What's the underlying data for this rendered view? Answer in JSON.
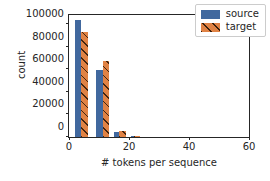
{
  "chart_data": {
    "type": "bar",
    "title": "",
    "xlabel": "# tokens per sequence",
    "ylabel": "count",
    "xlim": [
      0,
      60
    ],
    "ylim": [
      0,
      108000
    ],
    "xticks": [
      0,
      20,
      40,
      60
    ],
    "xtick_labels": [
      "0",
      "20",
      "40",
      "60"
    ],
    "yticks": [
      0,
      20000,
      40000,
      60000,
      80000,
      100000
    ],
    "ytick_labels": [
      "0",
      "20000",
      "40000",
      "60000",
      "80000",
      "100000"
    ],
    "grid": false,
    "legend_position": "upper right",
    "bin_width": 5,
    "bin_starts": [
      2.5,
      9.0,
      15.0,
      21.0
    ],
    "categories": [
      "3-5",
      "10-12",
      "16-18",
      "22-23"
    ],
    "series": [
      {
        "name": "source",
        "color": "#41689e",
        "hatch": "none",
        "values": [
          104000,
          59000,
          4000,
          600
        ],
        "x_positions": [
          3.0,
          10.2,
          16.0,
          21.6
        ]
      },
      {
        "name": "target",
        "color": "#e08244",
        "hatch": "diagonal",
        "values": [
          93000,
          67000,
          5500,
          500
        ],
        "x_positions": [
          5.2,
          12.4,
          17.8,
          22.6
        ]
      }
    ]
  },
  "legend": {
    "entries": [
      {
        "label": "source",
        "swatch": "legend-swatch-source"
      },
      {
        "label": "target",
        "swatch": "legend-swatch-target"
      }
    ]
  },
  "axis": {
    "x_title": "# tokens per sequence",
    "y_title": "count"
  }
}
